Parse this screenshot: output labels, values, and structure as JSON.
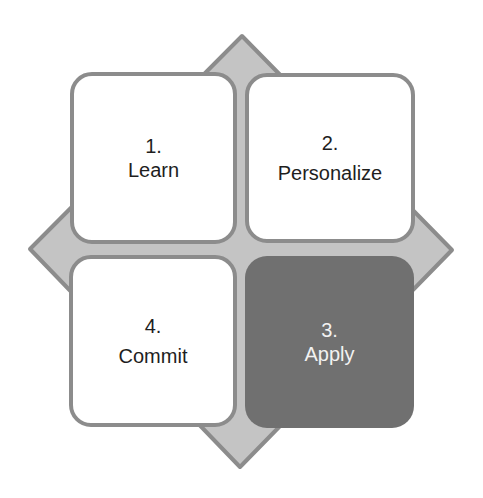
{
  "diagram": {
    "title": "",
    "colors": {
      "diamond_fill": "#c4c4c4",
      "diamond_stroke": "#8c8c8c",
      "light_box_fill": "#ffffff",
      "light_box_border": "#8c8c8c",
      "dark_box_fill": "#707070",
      "dark_text": "#1e1e1e",
      "light_text": "#f2f2f2"
    },
    "steps": [
      {
        "number": "1.",
        "label": "Learn",
        "position": "top-left",
        "style": "light"
      },
      {
        "number": "2.",
        "label": "Personalize",
        "position": "top-right",
        "style": "light"
      },
      {
        "number": "3.",
        "label": "Apply",
        "position": "bottom-right",
        "style": "dark"
      },
      {
        "number": "4.",
        "label": "Commit",
        "position": "bottom-left",
        "style": "light"
      }
    ]
  }
}
